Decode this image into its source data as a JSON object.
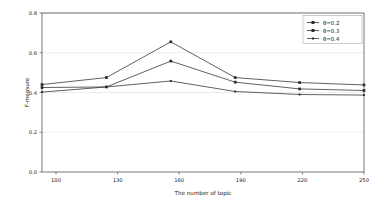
{
  "chart_data": {
    "type": "line",
    "title": "",
    "xlabel": "The number of topic",
    "ylabel": "F-measure",
    "categories": [
      100,
      130,
      160,
      190,
      220,
      250
    ],
    "x": [
      100,
      130,
      160,
      190,
      220,
      250
    ],
    "xtick_labels": [
      "100",
      "130",
      "160",
      "190",
      "220",
      "250"
    ],
    "ytick_labels": [
      "0.0",
      "0.2",
      "0.4",
      "0.6",
      "0.8"
    ],
    "yticks": [
      0.0,
      0.2,
      0.4,
      0.6,
      0.8
    ],
    "ylim": [
      0.0,
      0.8
    ],
    "xlim": [
      100,
      250
    ],
    "grid": true,
    "grid_axis": "y",
    "legend_position": "upper right",
    "marker": "square",
    "line_color": "#2b2b2b",
    "series": [
      {
        "name": "θ=0.2",
        "values": [
          0.44,
          0.475,
          0.655,
          0.475,
          0.45,
          0.438
        ]
      },
      {
        "name": "θ=0.3",
        "values": [
          0.425,
          0.428,
          0.558,
          0.452,
          0.418,
          0.41
        ]
      },
      {
        "name": "θ=0.4",
        "values": [
          0.402,
          0.428,
          0.458,
          0.405,
          0.39,
          0.387
        ]
      }
    ]
  },
  "legend": {
    "entries": [
      "θ=0.2",
      "θ=0.3",
      "θ=0.4"
    ]
  },
  "axes": {
    "x_title": "The number of topic",
    "y_title": "F-measure",
    "x_ticks": [
      "100",
      "130",
      "160",
      "190",
      "220",
      "250"
    ],
    "y_ticks": [
      "0.0",
      "0.2",
      "0.4",
      "0.6",
      "0.8"
    ]
  }
}
